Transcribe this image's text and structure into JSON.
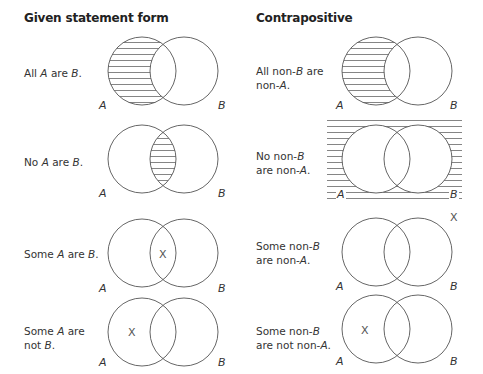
{
  "headers": {
    "left": "Given statement form",
    "right": "Contrapositive"
  },
  "rows": [
    {
      "given": {
        "parts": [
          "All ",
          "A",
          " are ",
          "B",
          "."
        ],
        "text": "All A are B.",
        "shading": "A-only",
        "x_mark": null
      },
      "contra": {
        "line1": [
          "All non-",
          "B",
          " are"
        ],
        "line2": [
          "non-",
          "A",
          "."
        ],
        "text": "All non-B are non-A.",
        "shading": "A-only",
        "x_mark": null
      }
    },
    {
      "given": {
        "parts": [
          "No ",
          "A",
          " are ",
          "B",
          "."
        ],
        "text": "No A are B.",
        "shading": "intersection",
        "x_mark": null
      },
      "contra": {
        "line1": [
          "No non-",
          "B",
          ""
        ],
        "line2": [
          "are non-",
          "A",
          "."
        ],
        "text": "No non-B are non-A.",
        "shading": "outside",
        "x_mark": null
      }
    },
    {
      "given": {
        "parts": [
          "Some ",
          "A",
          " are ",
          "B",
          "."
        ],
        "text": "Some A are B.",
        "shading": "none",
        "x_mark": "intersection"
      },
      "contra": {
        "line1": [
          "Some non-",
          "B",
          ""
        ],
        "line2": [
          "are non-",
          "A",
          "."
        ],
        "text": "Some non-B are non-A.",
        "shading": "none",
        "x_mark": "outside"
      }
    },
    {
      "given": {
        "line1": [
          "Some ",
          "A",
          " are"
        ],
        "line2": [
          "not ",
          "B",
          "."
        ],
        "text": "Some A are not B.",
        "shading": "none",
        "x_mark": "A-only"
      },
      "contra": {
        "line1": [
          "Some non-",
          "B",
          ""
        ],
        "line2": [
          "are not non-",
          "A",
          "."
        ],
        "text": "Some non-B are not non-A.",
        "shading": "none",
        "x_mark": "A-only"
      }
    }
  ],
  "labels": {
    "a": "A",
    "b": "B",
    "x": "X"
  }
}
